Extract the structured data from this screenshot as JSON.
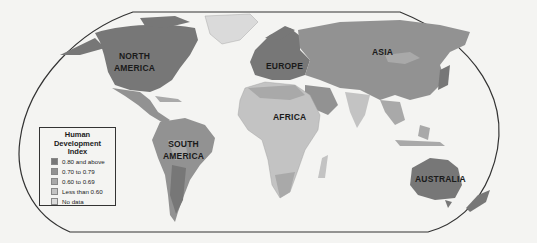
{
  "map": {
    "title": "Human Development Index",
    "regions": [
      {
        "name": "NORTH AMERICA",
        "lines": [
          "NORTH",
          "AMERICA"
        ],
        "category": "0.80 and above"
      },
      {
        "name": "SOUTH AMERICA",
        "lines": [
          "SOUTH",
          "AMERICA"
        ],
        "category": "0.70 to 0.79"
      },
      {
        "name": "EUROPE",
        "lines": [
          "EUROPE"
        ],
        "category": "0.80 and above"
      },
      {
        "name": "AFRICA",
        "lines": [
          "AFRICA"
        ],
        "category": "Less than 0.60"
      },
      {
        "name": "ASIA",
        "lines": [
          "ASIA"
        ],
        "category": "0.70 to 0.79"
      },
      {
        "name": "AUSTRALIA",
        "lines": [
          "AUSTRALIA"
        ],
        "category": "0.80 and above"
      }
    ]
  },
  "legend": {
    "title_line1": "Human Development",
    "title_line2": "Index",
    "items": [
      {
        "label": "0.80 and above",
        "color": "#777777"
      },
      {
        "label": "0.70 to 0.79",
        "color": "#929292"
      },
      {
        "label": "0.60 to 0.69",
        "color": "#a9a9a9"
      },
      {
        "label": "Less than 0.60",
        "color": "#c3c3c3"
      },
      {
        "label": "No data",
        "color": "#dadada"
      }
    ]
  },
  "colors": {
    "very_high": "#777777",
    "high": "#929292",
    "medium": "#a9a9a9",
    "low": "#c3c3c3",
    "no_data": "#dadada",
    "ocean": "#f4f4f2",
    "border": "#333333"
  }
}
